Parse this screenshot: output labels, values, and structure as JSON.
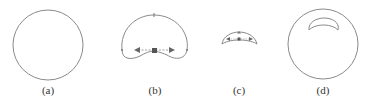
{
  "figure": {
    "panels": [
      {
        "id": "a",
        "label": "(a)",
        "shape": "circle"
      },
      {
        "id": "b",
        "label": "(b)",
        "shape": "deformed-cap-with-arrows"
      },
      {
        "id": "c",
        "label": "(c)",
        "shape": "small-crescent-with-arrows"
      },
      {
        "id": "d",
        "label": "(d)",
        "shape": "circle-with-crescent-cavity"
      }
    ],
    "stroke_color": "#8a8a8a",
    "marker_color": "#666666"
  }
}
